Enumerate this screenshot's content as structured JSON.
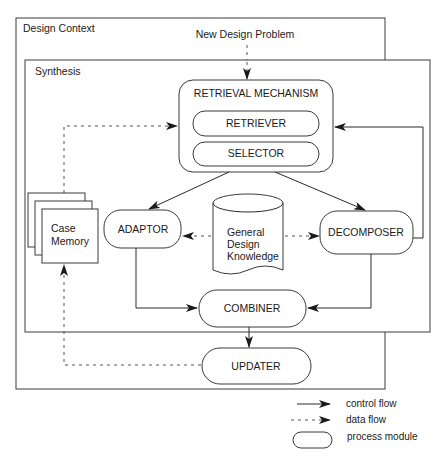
{
  "containers": {
    "design_context": "Design Context",
    "synthesis": "Synthesis",
    "input": "New Design Problem"
  },
  "modules": {
    "retrieval_mechanism": "RETRIEVAL MECHANISM",
    "retriever": "RETRIEVER",
    "selector": "SELECTOR",
    "adaptor": "ADAPTOR",
    "decomposer": "DECOMPOSER",
    "combiner": "COMBINER",
    "updater": "UPDATER"
  },
  "stores": {
    "case_memory": [
      "Case",
      "Memory"
    ],
    "general_design_knowledge": [
      "General",
      "Design",
      "Knowledge"
    ]
  },
  "legend": {
    "control_flow": "control flow",
    "data_flow": "data flow",
    "process_module": "process module"
  },
  "edges": [
    {
      "from": "New Design Problem",
      "to": "RETRIEVAL MECHANISM",
      "type": "data"
    },
    {
      "from": "Case Memory",
      "to": "RETRIEVAL MECHANISM",
      "type": "data"
    },
    {
      "from": "DECOMPOSER",
      "to": "RETRIEVAL MECHANISM",
      "type": "control"
    },
    {
      "from": "RETRIEVAL MECHANISM",
      "to": "ADAPTOR",
      "type": "control"
    },
    {
      "from": "RETRIEVAL MECHANISM",
      "to": "DECOMPOSER",
      "type": "control"
    },
    {
      "from": "General Design Knowledge",
      "to": "ADAPTOR",
      "type": "data"
    },
    {
      "from": "General Design Knowledge",
      "to": "DECOMPOSER",
      "type": "data"
    },
    {
      "from": "ADAPTOR",
      "to": "COMBINER",
      "type": "control"
    },
    {
      "from": "DECOMPOSER",
      "to": "COMBINER",
      "type": "control"
    },
    {
      "from": "COMBINER",
      "to": "UPDATER",
      "type": "control"
    },
    {
      "from": "UPDATER",
      "to": "Case Memory",
      "type": "data"
    }
  ]
}
